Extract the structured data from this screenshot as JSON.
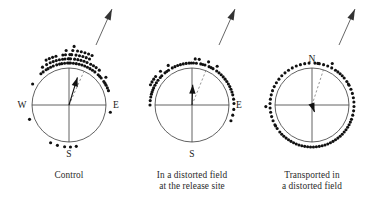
{
  "figure": {
    "type": "circular-orientation-diagram-set",
    "panel_count": 3,
    "colors": {
      "dot": "#111111",
      "circle": "#3a3a3a",
      "mean_vector": "#111111",
      "dashed_home_direction": "#777777",
      "text": "#1a1a1a",
      "background": "#ffffff"
    },
    "geometry": {
      "circle_radius": 37,
      "dot_radius": 1.55,
      "dot_offset_outside": 5
    }
  },
  "panels": [
    {
      "id": "control",
      "caption_lines": [
        "Control"
      ],
      "center": {
        "x": 69,
        "y": 105
      },
      "cardinals": [
        {
          "label": "W",
          "x": 22,
          "y": 108,
          "anchor": "middle"
        },
        {
          "label": "E",
          "x": 116,
          "y": 108,
          "anchor": "middle"
        },
        {
          "label": "S",
          "x": 69,
          "y": 157,
          "anchor": "middle"
        }
      ],
      "home_arrow": {
        "from_x": 96,
        "from_y": 45,
        "to_x": 112,
        "to_y": 9
      },
      "mean_vector": {
        "bearing_deg": 17,
        "length_ratio": 0.78
      },
      "dashed_direction": {
        "bearing_deg": 24,
        "length_ratio": 1.0
      },
      "bearings_deg": [
        300,
        318,
        322,
        325,
        327,
        330,
        331,
        333,
        334,
        336,
        337,
        338,
        340,
        341,
        343,
        344,
        345,
        347,
        348,
        350,
        352,
        353,
        354,
        355,
        356,
        357,
        358,
        359,
        0,
        0,
        1,
        2,
        2,
        3,
        4,
        5,
        6,
        7,
        8,
        9,
        10,
        11,
        12,
        13,
        14,
        15,
        16,
        17,
        18,
        19,
        20,
        21,
        22,
        23,
        24,
        25,
        26,
        28,
        30,
        32,
        34,
        36,
        38,
        41,
        44,
        47,
        50,
        53,
        56,
        59,
        62,
        66,
        70,
        100,
        170,
        178,
        186,
        196,
        206,
        250
      ]
    },
    {
      "id": "distorted-field-release-site",
      "caption_lines": [
        "In a distorted field",
        "at the release site"
      ],
      "center": {
        "x": 192,
        "y": 105
      },
      "cardinals": [
        {
          "label": "E",
          "x": 239,
          "y": 108,
          "anchor": "middle"
        },
        {
          "label": "S",
          "x": 192,
          "y": 157,
          "anchor": "middle"
        }
      ],
      "home_arrow": {
        "from_x": 219,
        "from_y": 45,
        "to_x": 235,
        "to_y": 9
      },
      "mean_vector": {
        "bearing_deg": 2,
        "length_ratio": 0.55
      },
      "dashed_direction": {
        "bearing_deg": 22,
        "length_ratio": 1.0
      },
      "bearings_deg": [
        270,
        276,
        281,
        285,
        288,
        291,
        294,
        296,
        298,
        300,
        302,
        304,
        306,
        308,
        311,
        314,
        317,
        320,
        323,
        326,
        329,
        332,
        336,
        340,
        344,
        348,
        352,
        356,
        359,
        2,
        4,
        6,
        9,
        12,
        15,
        18,
        21,
        24,
        27,
        30,
        33,
        36,
        40,
        44,
        48,
        52,
        56,
        60,
        64,
        68,
        72,
        76,
        82,
        88,
        96,
        104,
        112
      ]
    },
    {
      "id": "transported-in-distorted-field",
      "caption_lines": [
        "Transported in",
        "a distorted field"
      ],
      "center": {
        "x": 312,
        "y": 105
      },
      "cardinals": [
        {
          "label": "N",
          "x": 312,
          "y": 62,
          "anchor": "middle"
        }
      ],
      "home_arrow": {
        "from_x": 339,
        "from_y": 45,
        "to_x": 355,
        "to_y": 9
      },
      "mean_vector": {
        "bearing_deg": 160,
        "length_ratio": 0.2
      },
      "dashed_direction": {
        "bearing_deg": 18,
        "length_ratio": 1.0
      },
      "bearings_deg": [
        4,
        10,
        16,
        22,
        28,
        34,
        38,
        42,
        46,
        50,
        56,
        62,
        68,
        74,
        80,
        86,
        92,
        98,
        104,
        110,
        114,
        118,
        122,
        126,
        130,
        134,
        138,
        142,
        146,
        150,
        154,
        158,
        162,
        166,
        170,
        174,
        178,
        182,
        186,
        190,
        194,
        198,
        202,
        206,
        210,
        214,
        218,
        222,
        226,
        230,
        236,
        242,
        248,
        254,
        260,
        266,
        272,
        278,
        284,
        290,
        296,
        302,
        308,
        314,
        320,
        326,
        332,
        338,
        344,
        350,
        356,
        8,
        26,
        60,
        240,
        268
      ]
    }
  ]
}
